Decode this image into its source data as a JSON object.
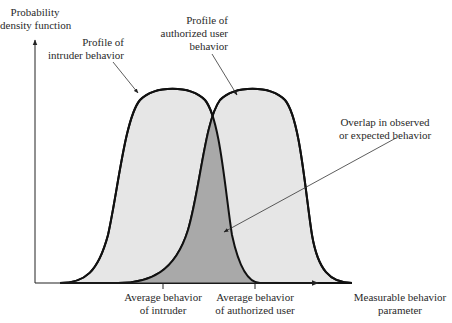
{
  "diagram": {
    "y_axis_label": [
      "Probability",
      "density function"
    ],
    "x_axis_label": [
      "Measurable behavior",
      "parameter"
    ],
    "curves": [
      {
        "name": "intruder",
        "label": [
          "Profile of",
          "intruder behavior"
        ],
        "fill": "#e6e6e6",
        "stroke": "#111111"
      },
      {
        "name": "authorized-user",
        "label": [
          "Profile of",
          "authorized user",
          "behavior"
        ],
        "fill": "#e6e6e6",
        "stroke": "#111111"
      }
    ],
    "overlap": {
      "label": [
        "Overlap in observed",
        "or expected behavior"
      ],
      "fill": "#a9a9a9"
    },
    "ticks": [
      {
        "name": "average-intruder",
        "label": [
          "Average behavior",
          "of intruder"
        ]
      },
      {
        "name": "average-authorized-user",
        "label": [
          "Average behavior",
          "of authorized user"
        ]
      }
    ]
  },
  "colors": {
    "curve_fill": "#e6e6e6",
    "overlap_fill": "#a9a9a9",
    "stroke": "#111111",
    "background": "#ffffff"
  }
}
